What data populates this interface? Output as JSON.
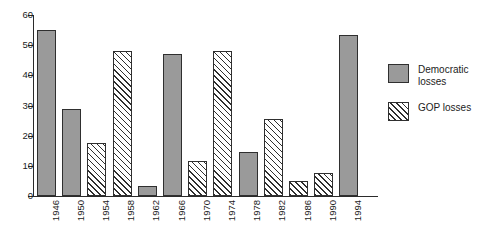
{
  "chart_data": {
    "type": "bar",
    "title": "",
    "xlabel": "",
    "ylabel": "",
    "ylim": [
      0,
      60
    ],
    "ytick_labels": [
      "60",
      "50",
      "40",
      "30",
      "20",
      "10",
      "0"
    ],
    "ytick_values": [
      60,
      50,
      40,
      30,
      20,
      10,
      0
    ],
    "grid": false,
    "legend_position": "right",
    "categories": [
      "1946",
      "1950",
      "1954",
      "1958",
      "1962",
      "1966",
      "1970",
      "1974",
      "1978",
      "1982",
      "1986",
      "1990",
      "1994"
    ],
    "bars": [
      {
        "category": "1946",
        "value": 55,
        "series": "Democratic losses"
      },
      {
        "category": "1950",
        "value": 29,
        "series": "Democratic losses"
      },
      {
        "category": "1954",
        "value": 17.5,
        "series": "GOP losses"
      },
      {
        "category": "1958",
        "value": 48,
        "series": "GOP losses"
      },
      {
        "category": "1962",
        "value": 3.3,
        "series": "Democratic losses"
      },
      {
        "category": "1966",
        "value": 47,
        "series": "Democratic losses"
      },
      {
        "category": "1970",
        "value": 11.5,
        "series": "GOP losses"
      },
      {
        "category": "1974",
        "value": 48,
        "series": "GOP losses"
      },
      {
        "category": "1978",
        "value": 14.5,
        "series": "Democratic losses"
      },
      {
        "category": "1982",
        "value": 25.5,
        "series": "GOP losses"
      },
      {
        "category": "1986",
        "value": 5,
        "series": "GOP losses"
      },
      {
        "category": "1990",
        "value": 7.5,
        "series": "GOP losses"
      },
      {
        "category": "1994",
        "value": 53.5,
        "series": "Democratic losses"
      }
    ],
    "series": [
      {
        "name": "Democratic losses",
        "style": "solid-gray",
        "color": "#9a9a9a"
      },
      {
        "name": "GOP losses",
        "style": "diagonal-hatch",
        "color": "#ffffff"
      }
    ]
  },
  "legend": {
    "items": [
      {
        "label": "Democratic losses",
        "style": "solid-gray"
      },
      {
        "label": "GOP losses",
        "style": "diagonal-hatch"
      }
    ]
  },
  "colors": {
    "democratic_fill": "#9a9a9a",
    "gop_fill": "#ffffff",
    "outline": "#2f2f2f",
    "axis": "#2b2b2b",
    "background": "#ffffff",
    "text": "#1c1c1c"
  }
}
